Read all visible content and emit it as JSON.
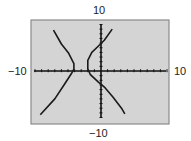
{
  "chart_data": {
    "type": "line",
    "title": "",
    "xlabel": "",
    "ylabel": "",
    "xlim": [
      -10,
      10
    ],
    "ylim": [
      -10,
      10
    ],
    "grid": false,
    "axis_labels": {
      "xmin": "−10",
      "xmax": "10",
      "ymin": "−10",
      "ymax": "10"
    },
    "tick_spacing": 1,
    "series": [
      {
        "name": "left-branch",
        "points": [
          [
            -7.2,
            8.8
          ],
          [
            -6.0,
            5.8
          ],
          [
            -4.9,
            3.8
          ],
          [
            -4.1,
            1.6
          ],
          [
            -4.1,
            0.4
          ],
          [
            -4.5,
            -0.6
          ],
          [
            -5.6,
            -3.0
          ],
          [
            -7.0,
            -6.0
          ],
          [
            -9.2,
            -9.4
          ]
        ]
      },
      {
        "name": "right-branch",
        "points": [
          [
            1.7,
            9.0
          ],
          [
            0.5,
            6.6
          ],
          [
            -0.5,
            5.2
          ],
          [
            -1.4,
            4.0
          ],
          [
            -2.0,
            2.3
          ],
          [
            -2.0,
            0.5
          ],
          [
            -1.6,
            -0.8
          ],
          [
            -0.4,
            -2.4
          ],
          [
            0.6,
            -3.6
          ],
          [
            1.8,
            -5.6
          ],
          [
            3.1,
            -8.0
          ],
          [
            3.6,
            -9.2
          ]
        ]
      }
    ],
    "colors": {
      "background": "#d4d4d4",
      "border": "#8a8a8a",
      "curve": "#1a1a1a",
      "axis": "#111111"
    }
  }
}
